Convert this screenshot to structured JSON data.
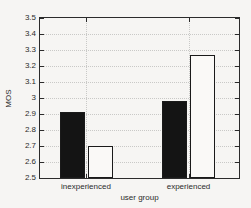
{
  "chart_data": {
    "type": "bar",
    "title": "",
    "xlabel": "user group",
    "ylabel": "MOS",
    "categories": [
      "inexperienced",
      "experienced"
    ],
    "series": [
      {
        "name": "filled-black-bar",
        "color": "#141414",
        "values": [
          2.91,
          2.98
        ]
      },
      {
        "name": "open-white-bar",
        "color": "#faf9f7",
        "values": [
          2.7,
          3.27
        ]
      }
    ],
    "ylim": [
      2.5,
      3.5
    ],
    "yticks": [
      2.5,
      2.6,
      2.7,
      2.8,
      2.9,
      3.0,
      3.1,
      3.2,
      3.3,
      3.4,
      3.5
    ],
    "ytick_labels": [
      "2.5",
      "2.6",
      "2.7",
      "2.8",
      "2.9",
      "3",
      "3.1",
      "3.2",
      "3.3",
      "3.4",
      "3.5"
    ],
    "grid": "dotted",
    "legend": "none",
    "edge_color": "#1a1a1a"
  },
  "colors": {
    "background": "#f6f5f3",
    "axis": "#2b2b2b",
    "grid": "#c9c9c7",
    "text": "#2b2b2b"
  }
}
